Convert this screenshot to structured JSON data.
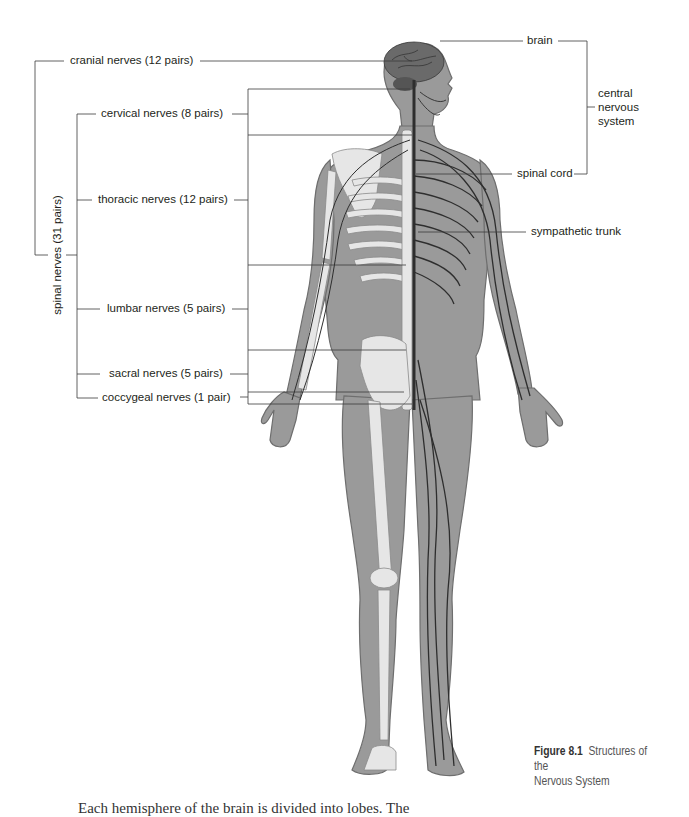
{
  "figure": {
    "number": "Figure 8.1",
    "title": "Structures of the",
    "title_line2": "Nervous System"
  },
  "labels": {
    "left": {
      "cranial": "cranial nerves (12 pairs)",
      "cervical": "cervical nerves (8 pairs)",
      "thoracic": "thoracic nerves (12 pairs)",
      "lumbar": "lumbar nerves (5 pairs)",
      "sacral": "sacral nerves (5 pairs)",
      "coccygeal": "coccygeal nerves (1 pair)",
      "spinal_group": "spinal nerves (31 pairs)"
    },
    "right": {
      "brain": "brain",
      "spinal_cord": "spinal cord",
      "sympathetic_trunk": "sympathetic trunk",
      "cns_line1": "central",
      "cns_line2": "nervous",
      "cns_line3": "system"
    }
  },
  "colors": {
    "body_fill": "#9a9a9a",
    "body_outline": "#6e6e6e",
    "bone": "#e6e6e6",
    "nerve": "#2e2e2e",
    "leader_line": "#3a3a3a",
    "text": "#231f20"
  },
  "bottom_text_partial": "Each hemisphere of the brain is divided into lobes. The"
}
